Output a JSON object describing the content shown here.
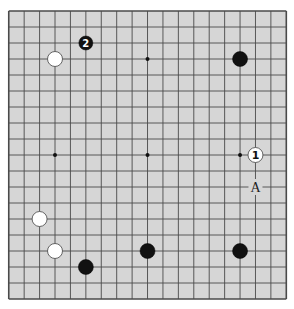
{
  "board": {
    "size": 19,
    "background": "#d6d6d6",
    "line_color": "#4a4a4a",
    "origin_x": 8.75,
    "origin_y": 11,
    "spacing_x": 15.42,
    "spacing_y": 16,
    "star_points": [
      [
        3,
        3
      ],
      [
        9,
        3
      ],
      [
        15,
        3
      ],
      [
        3,
        9
      ],
      [
        9,
        9
      ],
      [
        15,
        9
      ],
      [
        3,
        15
      ],
      [
        9,
        15
      ],
      [
        15,
        15
      ]
    ],
    "stones": [
      {
        "color": "black",
        "col": 5,
        "row": 2,
        "label": "2",
        "size": "small"
      },
      {
        "color": "white",
        "col": 3,
        "row": 3,
        "label": ""
      },
      {
        "color": "black",
        "col": 15,
        "row": 3,
        "label": ""
      },
      {
        "color": "white",
        "col": 16,
        "row": 9,
        "label": "1"
      },
      {
        "color": "white",
        "col": 2,
        "row": 13,
        "label": ""
      },
      {
        "color": "white",
        "col": 3,
        "row": 15,
        "label": ""
      },
      {
        "color": "black",
        "col": 9,
        "row": 15,
        "label": ""
      },
      {
        "color": "black",
        "col": 15,
        "row": 15,
        "label": ""
      },
      {
        "color": "black",
        "col": 5,
        "row": 16,
        "label": ""
      }
    ],
    "markers": [
      {
        "col": 16,
        "row": 11,
        "label": "A"
      }
    ]
  }
}
